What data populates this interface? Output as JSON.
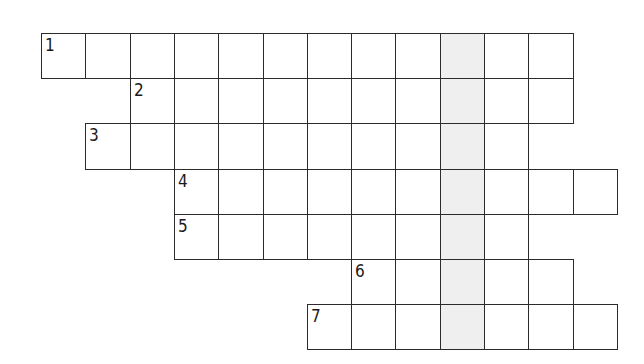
{
  "puzzle": {
    "type": "crossword-keyword",
    "cell_size": 44.3,
    "origin": {
      "x": 41,
      "y": 33
    },
    "row_height": 45.2,
    "shaded_column": 9,
    "colors": {
      "border": "#2b2b2b",
      "cell": "#ffffff",
      "shaded": "#efefef",
      "number": "#1a1a1a"
    },
    "rows": [
      {
        "number": "1",
        "start_col": 0,
        "end_col": 11
      },
      {
        "number": "2",
        "start_col": 2,
        "end_col": 11
      },
      {
        "number": "3",
        "start_col": 1,
        "end_col": 10
      },
      {
        "number": "4",
        "start_col": 3,
        "end_col": 12
      },
      {
        "number": "5",
        "start_col": 3,
        "end_col": 10
      },
      {
        "number": "6",
        "start_col": 7,
        "end_col": 11
      },
      {
        "number": "7",
        "start_col": 6,
        "end_col": 12
      }
    ]
  }
}
